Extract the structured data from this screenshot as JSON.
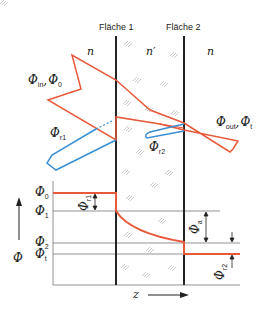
{
  "surfaces": {
    "surface1": "Fläche 1",
    "surface2": "Fläche 2"
  },
  "media": {
    "left": "n",
    "middle": "n′",
    "right": "n"
  },
  "beams": {
    "incident": {
      "symbol": "Φ",
      "sub1": "in",
      "sep": ",",
      "sub2": "0"
    },
    "reflected1": {
      "symbol": "Φ",
      "sub": "r1"
    },
    "reflected2": {
      "symbol": "Φ",
      "sub": "r2"
    },
    "transmitted": {
      "symbol": "Φ",
      "sub1": "out",
      "sep": ",",
      "sub2": "t"
    }
  },
  "levels": [
    {
      "symbol": "Φ",
      "sub": "0"
    },
    {
      "symbol": "Φ",
      "sub": "1"
    },
    {
      "symbol": "Φ",
      "sub": "2"
    },
    {
      "symbol": "Φ",
      "sub": "t"
    }
  ],
  "differences": {
    "r1": {
      "symbol": "Φ",
      "sub": "r1"
    },
    "a": {
      "symbol": "Φ",
      "sub": "a"
    },
    "r2": {
      "symbol": "Φ",
      "sub": "r2"
    }
  },
  "axes": {
    "y": "Φ",
    "x": "z"
  },
  "colors": {
    "flux": "#e8593a",
    "reflection": "#3b8fd4",
    "surface": "#222222",
    "grid": "#777777"
  }
}
